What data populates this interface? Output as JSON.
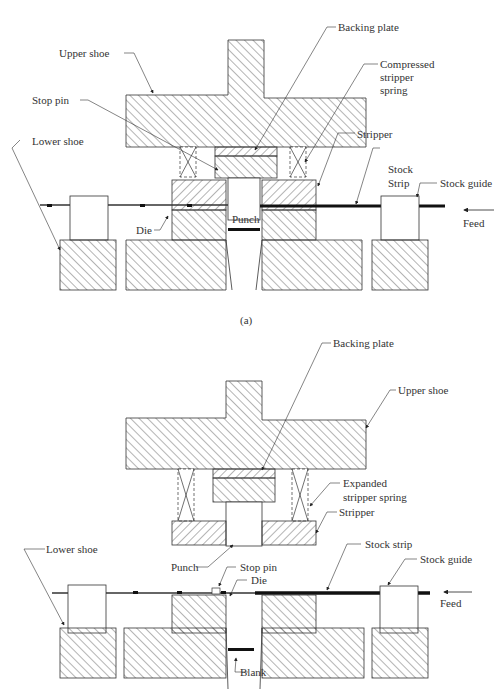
{
  "figure": {
    "top_cut_text": "figure caption continued from previous page (cut off)",
    "panel_a": {
      "caption": "(a)",
      "state": "compressed",
      "labels": {
        "upper_shoe": "Upper shoe",
        "backing_plate": "Backing plate",
        "compressed_spring_line1": "Compressed",
        "compressed_spring_line2": "stripper",
        "compressed_spring_line3": "spring",
        "stop_pin": "Stop pin",
        "stripper": "Stripper",
        "lower_shoe": "Lower shoe",
        "stock_line1": "Stock",
        "stock_line2": "Strip",
        "stock_guide": "Stock guide",
        "die": "Die",
        "punch": "Punch",
        "feed": "Feed"
      }
    },
    "panel_b": {
      "state": "expanded",
      "labels": {
        "backing_plate": "Backing plate",
        "upper_shoe": "Upper shoe",
        "expanded_spring_line1": "Expanded",
        "expanded_spring_line2": "stripper spring",
        "stripper": "Stripper",
        "lower_shoe": "Lower shoe",
        "stock_strip": "Stock strip",
        "stock_guide": "Stock  guide",
        "punch": "Punch",
        "stop_pin": "Stop pin",
        "die": "Die",
        "feed": "Feed",
        "blank": "Blank"
      }
    }
  }
}
